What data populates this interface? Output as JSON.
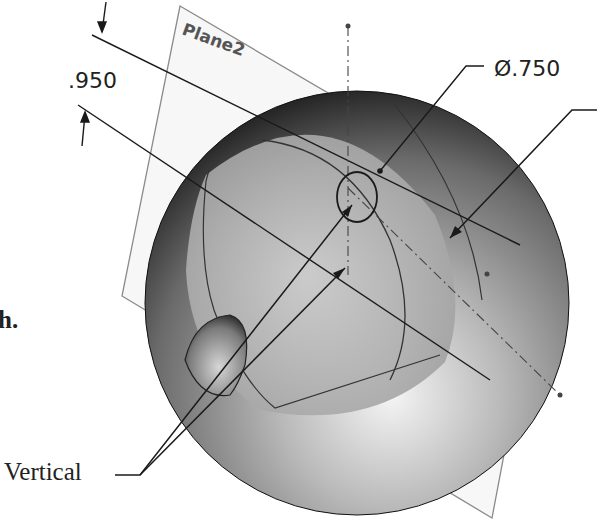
{
  "diagram": {
    "plane_label": "Plane2",
    "dimensions": {
      "linear": ".950",
      "diameter": "Ø.750"
    },
    "callouts": {
      "vertical": "Vertical"
    },
    "text_fragment": "h.",
    "colors": {
      "line": "#1a1a1a",
      "plane_edge": "#8a8a8a",
      "sphere_light": "#f2f2f2",
      "sphere_dark": "#1e1e1e"
    }
  }
}
